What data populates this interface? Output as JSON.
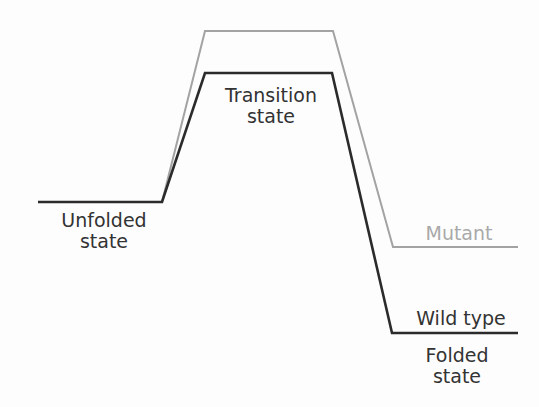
{
  "diagram": {
    "colors": {
      "background": "#fdfdfd",
      "wild_type_line": "#2b2b2b",
      "mutant_line": "#a3a3a3",
      "label_text": "#333333",
      "mutant_text": "#a9a9a9"
    },
    "labels": {
      "unfolded_line1": "Unfolded",
      "unfolded_line2": "state",
      "transition_line1": "Transition",
      "transition_line2": "state",
      "mutant": "Mutant",
      "wild_type": "Wild type",
      "folded_line1": "Folded",
      "folded_line2": "state"
    },
    "paths": {
      "wild_type": "M38,202 L162,202 L205,73 L332,73 L392,333 L518,333",
      "mutant": "M162,202 L205,31 L333,31 L393,247 L518,247"
    },
    "states": [
      {
        "name": "Unfolded state",
        "wild_type_level": 202,
        "mutant_level": 202
      },
      {
        "name": "Transition state",
        "wild_type_level": 73,
        "mutant_level": 31
      },
      {
        "name": "Folded state",
        "wild_type_level": 333,
        "mutant_level": 247
      }
    ]
  }
}
